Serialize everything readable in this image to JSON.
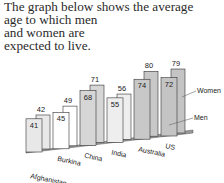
{
  "title": {
    "line1": "The graph below shows the average",
    "rest": "age to which men and women are expected to live."
  },
  "chart_data": {
    "type": "bar",
    "title": "The graph below shows the average age to which men and women are expected to live.",
    "categories": [
      "Afghanistan",
      "Burkina",
      "China",
      "India",
      "Australia",
      "US"
    ],
    "series": [
      {
        "name": "Men",
        "values": [
          41,
          45,
          68,
          55,
          74,
          72
        ]
      },
      {
        "name": "Women",
        "values": [
          42,
          49,
          71,
          56,
          80,
          79
        ]
      }
    ],
    "xlabel": "",
    "ylabel": "",
    "grid": false,
    "legend": [
      "Women",
      "Men"
    ],
    "legend_position": "right",
    "style": "3d-perspective"
  },
  "colors": {
    "Afghanistan": "#e8e8e8",
    "Burkina": "#ffffff",
    "China": "#d6d6d6",
    "India": "#eeeeee",
    "Australia": "#c8c8c8",
    "US": "#c4c4c4",
    "outline": "#333333"
  }
}
